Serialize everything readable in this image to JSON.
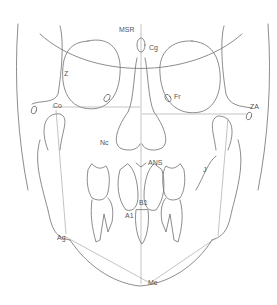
{
  "diagram": {
    "colors": {
      "line": "#6e6e6e",
      "ref_line": "#9a9a9a",
      "label": "#555555",
      "background": "#ffffff"
    },
    "landmarks": [
      {
        "id": "msr",
        "label": "MSR",
        "x": 119,
        "y": 28
      },
      {
        "id": "cg",
        "label": "Cg",
        "x": 149,
        "y": 45
      },
      {
        "id": "z",
        "label": "Z",
        "x": 64,
        "y": 71
      },
      {
        "id": "fr",
        "label": "Fr",
        "x": 174,
        "y": 94
      },
      {
        "id": "co",
        "label": "Co",
        "x": 53,
        "y": 104
      },
      {
        "id": "za",
        "label": "ZA",
        "x": 250,
        "y": 104
      },
      {
        "id": "nc",
        "label": "Nc",
        "x": 100,
        "y": 140
      },
      {
        "id": "ans",
        "label": "ANS",
        "x": 148,
        "y": 160
      },
      {
        "id": "j",
        "label": "J",
        "x": 203,
        "y": 168
      },
      {
        "id": "b1",
        "label": "B1",
        "x": 139,
        "y": 200
      },
      {
        "id": "a1",
        "label": "A1",
        "x": 125,
        "y": 213
      },
      {
        "id": "ag",
        "label": "Ag",
        "x": 57,
        "y": 235
      },
      {
        "id": "me",
        "label": "Me",
        "x": 148,
        "y": 281
      }
    ]
  }
}
